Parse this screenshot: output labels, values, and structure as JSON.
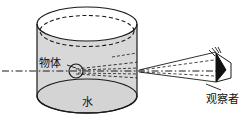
{
  "figure": {
    "title_visible": false,
    "background_color": "#ffffff",
    "stroke_color": "#1a1a1a",
    "cylinder_fill": "#d8d8d8",
    "cylinder_top_fill": "#ffffff",
    "eye_fill": "#111111",
    "labels": {
      "object": "物体",
      "water": "水",
      "observer": "观察者"
    },
    "elements": {
      "cylinder_name": "water-cylinder",
      "object_name": "submerged-object",
      "eye_name": "observer-eye",
      "axis_name": "optical-axis",
      "rays_name": "light-ray-cone",
      "leader_name": "object-leader-line"
    }
  }
}
